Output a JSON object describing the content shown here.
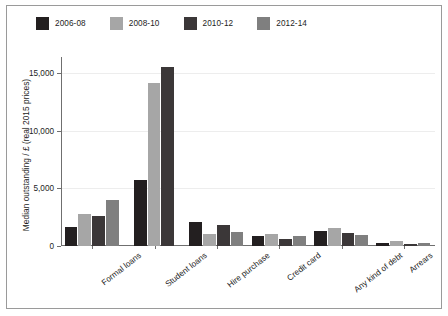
{
  "chart_data": {
    "type": "bar",
    "title": "",
    "xlabel": "",
    "ylabel": "Median outstanding / £ (real 2015 prices)",
    "ylim": [
      0,
      16200
    ],
    "yticks": [
      0,
      5000,
      10000,
      15000
    ],
    "ytick_labels": [
      "0",
      "5,000",
      "10,000",
      "15,000"
    ],
    "grid": true,
    "legend_position": "top-left",
    "categories": [
      "Formal loans",
      "Student loans",
      "Hire purchase",
      "Credit card",
      "Any kind of debt",
      "Arrears"
    ],
    "series": [
      {
        "name": "2006-08",
        "color": "#231f20",
        "values": [
          1650,
          5700,
          2100,
          850,
          1300,
          300
        ]
      },
      {
        "name": "2008-10",
        "color": "#a6a6a6",
        "values": [
          2800,
          14100,
          1000,
          1050,
          1550,
          400
        ]
      },
      {
        "name": "2010-12",
        "color": "#3b3738",
        "values": [
          2600,
          15500,
          1800,
          600,
          1100,
          180
        ]
      },
      {
        "name": "2012-14",
        "color": "#7f7f7f",
        "values": [
          4000,
          null,
          1250,
          850,
          950,
          300
        ]
      }
    ]
  },
  "figure": {
    "background_color": "#ffffff",
    "border_color": "#9a9a9a",
    "axis_color": "#6f6f6f",
    "gridline_color": "#ededed",
    "text_color": "#1d1d1d"
  }
}
